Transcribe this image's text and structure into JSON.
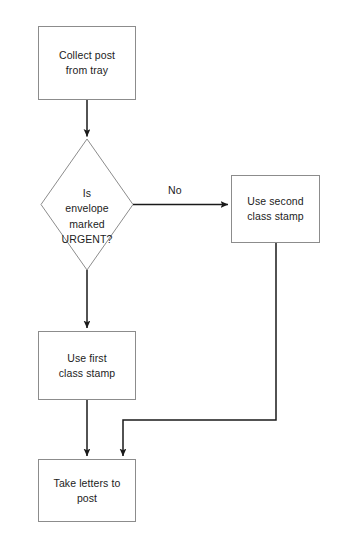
{
  "diagram": {
    "type": "flowchart",
    "colors": {
      "node_border": "#8c8c8c",
      "connector": "#1a1a1a",
      "text": "#1c1c1c",
      "background": "#ffffff"
    },
    "nodes": [
      {
        "id": "collect-post",
        "shape": "process",
        "label": "Collect post\nfrom tray"
      },
      {
        "id": "is-urgent",
        "shape": "decision",
        "label": "Is\nenvelope\nmarked\nURGENT?"
      },
      {
        "id": "second-class",
        "shape": "process",
        "label": "Use second\nclass stamp"
      },
      {
        "id": "first-class",
        "shape": "process",
        "label": "Use first\nclass stamp"
      },
      {
        "id": "take-letters",
        "shape": "process",
        "label": "Take letters to\npost"
      }
    ],
    "edges": [
      {
        "id": "e1",
        "from": "collect-post",
        "to": "is-urgent",
        "label": ""
      },
      {
        "id": "e2",
        "from": "is-urgent",
        "to": "second-class",
        "label": "No"
      },
      {
        "id": "e3",
        "from": "is-urgent",
        "to": "first-class",
        "label": ""
      },
      {
        "id": "e4",
        "from": "first-class",
        "to": "take-letters",
        "label": ""
      },
      {
        "id": "e5",
        "from": "second-class",
        "to": "take-letters",
        "label": ""
      }
    ]
  }
}
